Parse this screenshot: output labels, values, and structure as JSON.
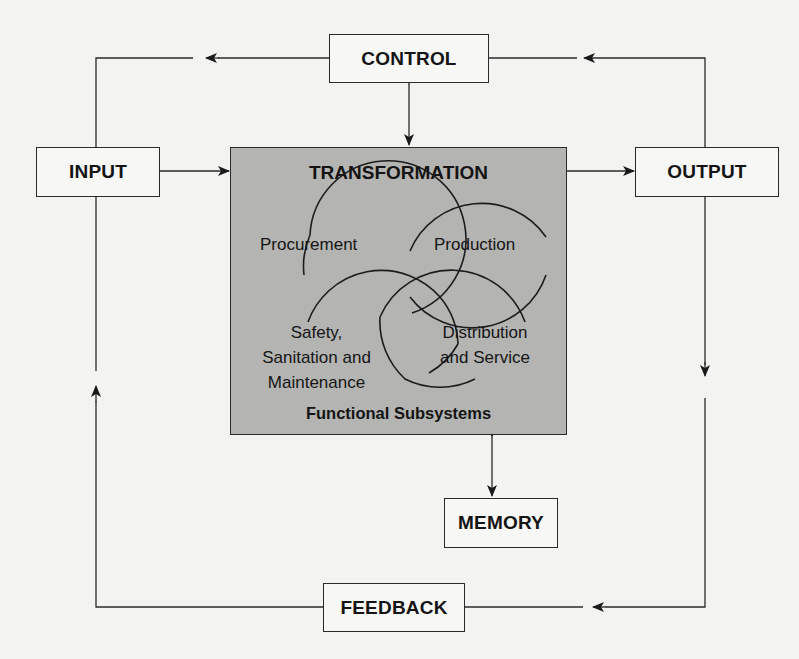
{
  "diagram": {
    "nodes": {
      "control": "CONTROL",
      "input": "INPUT",
      "output": "OUTPUT",
      "memory": "MEMORY",
      "feedback": "FEEDBACK",
      "transformation": {
        "title": "TRANSFORMATION",
        "footer": "Functional Subsystems",
        "subsystems": [
          {
            "line1": "Procurement"
          },
          {
            "line1": "Production"
          },
          {
            "line1": "Safety,",
            "line2": "Sanitation and",
            "line3": "Maintenance"
          },
          {
            "line1": "Distribution",
            "line2": "and Service"
          }
        ]
      }
    },
    "edges": [
      {
        "from": "input",
        "to": "transformation",
        "type": "arrow"
      },
      {
        "from": "transformation",
        "to": "output",
        "type": "arrow"
      },
      {
        "from": "control",
        "to": "transformation",
        "type": "bidirectional"
      },
      {
        "from": "transformation",
        "to": "memory",
        "type": "bidirectional"
      },
      {
        "from": "output",
        "to": "control",
        "type": "arrow"
      },
      {
        "from": "control",
        "to": "input",
        "type": "arrow"
      },
      {
        "from": "output",
        "to": "feedback",
        "type": "arrow"
      },
      {
        "from": "feedback",
        "to": "input",
        "type": "arrow"
      }
    ],
    "colors": {
      "background": "#f3f3f1",
      "transformation_fill": "#b4b4b2",
      "line": "#2a2a2a"
    }
  }
}
